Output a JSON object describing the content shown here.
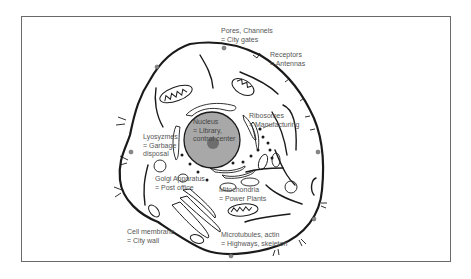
{
  "diagram": {
    "labels": [
      {
        "id": "pores",
        "line1": "Pores, Channels",
        "line2": "= City gates"
      },
      {
        "id": "receptors",
        "line1": "Receptors",
        "line2": "= Antennas"
      },
      {
        "id": "nucleus",
        "line1": "Nucleus",
        "line2": "= Library,",
        "line3": "control center"
      },
      {
        "id": "ribosomes",
        "line1": "Ribosomes",
        "line2": "= Manufacturing"
      },
      {
        "id": "lysozymes",
        "line1": "Lyosyzmes",
        "line2": "= Garbage",
        "line3": "disposal"
      },
      {
        "id": "golgi",
        "line1": "Golgi Apparatus",
        "line2": "= Post office"
      },
      {
        "id": "mitochondria",
        "line1": "Mitochondria",
        "line2": "= Power Plants"
      },
      {
        "id": "membrane",
        "line1": "Cell membrane",
        "line2": "= City wall"
      },
      {
        "id": "microtubules",
        "line1": "Microtubules, actin",
        "line2": "= Highways, skeleton"
      }
    ],
    "colors": {
      "outline": "#1a1a1a",
      "nucleus_fill": "#a8a8a8",
      "nucleolus": "#6e6e6e",
      "text": "#555555",
      "frame": "#6a6a6a"
    }
  }
}
